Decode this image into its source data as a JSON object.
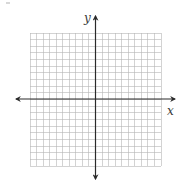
{
  "diagram": {
    "type": "coordinate-plane",
    "axes": {
      "x_label": "x",
      "y_label": "y",
      "arrows": "both-ends"
    },
    "grid": {
      "columns": 20,
      "rows": 20,
      "cells_left_of_y_axis": 10,
      "cells_right_of_y_axis": 10,
      "cells_above_x_axis": 10,
      "cells_below_x_axis": 10
    },
    "colors": {
      "grid_line": "#b5b5b5",
      "axis": "#2a2a2a",
      "label": "#3a3a3a",
      "background": "#ffffff"
    }
  }
}
